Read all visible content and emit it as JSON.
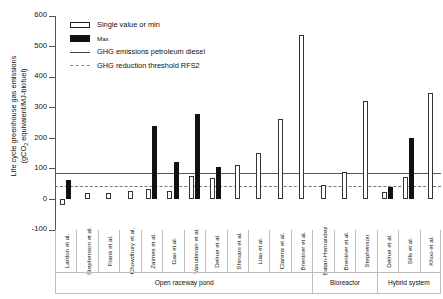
{
  "chart_data": {
    "type": "bar",
    "title": "",
    "xlabel": "",
    "ylabel_line1": "Life cycle greenhouse gas emissions",
    "ylabel_line2_pre": "(gCO",
    "ylabel_line2_sub": "2",
    "ylabel_line2_post": " equivalent/MJ-biofuel)",
    "ylim": [
      -100,
      600
    ],
    "yticks": [
      -100,
      0,
      100,
      200,
      300,
      400,
      500,
      600
    ],
    "ytick_labels": [
      "-100",
      "0",
      "100",
      "200",
      "300",
      "400",
      "500",
      "600"
    ],
    "grid": false,
    "legend_position": "top-left",
    "categories": [
      "Lardon et al.",
      "Stephenson et al.",
      "Frank et al.",
      "Chowdhury et al.",
      "Zaimes et al.",
      "Gao et al.",
      "Vasudevan et al.",
      "Delrue et al.",
      "Shirvani et al.",
      "Liao et al.",
      "Clarens et al.",
      "Brentner et al.",
      "Batan-Hernandez",
      "Brentner et al.",
      "Stephenson",
      "Delrue et al.",
      "Sills et al.",
      "Khoo et al."
    ],
    "series": [
      {
        "name": "Single value or min",
        "color": "#ffffff",
        "values": [
          -20,
          20,
          18,
          26,
          32,
          26,
          75,
          68,
          110,
          150,
          262,
          536,
          45,
          88,
          320,
          22,
          72,
          345
        ]
      },
      {
        "name": "Max",
        "color": "#111111",
        "values": [
          62,
          null,
          null,
          null,
          240,
          122,
          278,
          105,
          null,
          null,
          null,
          null,
          null,
          null,
          null,
          38,
          200,
          null
        ]
      }
    ],
    "reference_lines": [
      {
        "label": "GHG emissions petroleum diesel",
        "value": 84,
        "style": "solid",
        "color": "#555555"
      },
      {
        "label": "GHG reduction threshold RFS2",
        "value": 42,
        "style": "dashed",
        "color": "#777777"
      }
    ],
    "groups": [
      {
        "label": "Open raceway pond",
        "start": 0,
        "end": 11
      },
      {
        "label": "Bioreactor",
        "start": 12,
        "end": 14
      },
      {
        "label": "Hybrid system",
        "start": 15,
        "end": 17
      }
    ]
  },
  "legend": {
    "items": [
      {
        "key": "min-swatch",
        "label": "Single value or min"
      },
      {
        "key": "max-swatch",
        "label": "Max"
      },
      {
        "key": "solid-line",
        "label": "GHG emissions petroleum diesel"
      },
      {
        "key": "dashed-line",
        "label": "GHG reduction threshold RFS2"
      }
    ]
  }
}
